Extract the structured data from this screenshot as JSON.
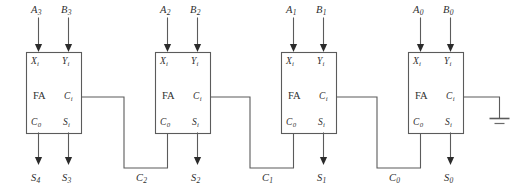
{
  "diagram": {
    "block_label": "FA",
    "pin_labels": {
      "x_in": "X",
      "x_in_sub": "i",
      "y_in": "Y",
      "y_in_sub": "i",
      "carry_in": "C",
      "carry_in_sub": "i",
      "carry_out": "C",
      "carry_out_sub": "0",
      "sum_out": "S",
      "sum_out_sub": "i"
    },
    "colors": {
      "wire": "#5b5b5b",
      "box_stroke": "#5b5b5b",
      "box_fill": "#ffffff",
      "text": "#2f2f2f",
      "arrowhead": "#2b2b2b",
      "background": "#ffffff"
    },
    "stages": [
      {
        "name": "stage-3",
        "input_a": "A",
        "input_a_sub": "3",
        "input_b": "B",
        "input_b_sub": "3",
        "sum_label": "S",
        "sum_label_sub": "3",
        "overflow_label": "S",
        "overflow_label_sub": "4",
        "carry_wire_label": "",
        "carry_wire_label_sub": ""
      },
      {
        "name": "stage-2",
        "input_a": "A",
        "input_a_sub": "2",
        "input_b": "B",
        "input_b_sub": "2",
        "sum_label": "S",
        "sum_label_sub": "2",
        "carry_wire_label": "C",
        "carry_wire_label_sub": "2"
      },
      {
        "name": "stage-1",
        "input_a": "A",
        "input_a_sub": "1",
        "input_b": "B",
        "input_b_sub": "1",
        "sum_label": "S",
        "sum_label_sub": "1",
        "carry_wire_label": "C",
        "carry_wire_label_sub": "1"
      },
      {
        "name": "stage-0",
        "input_a": "A",
        "input_a_sub": "0",
        "input_b": "B",
        "input_b_sub": "0",
        "sum_label": "S",
        "sum_label_sub": "0",
        "carry_wire_label": "C",
        "carry_wire_label_sub": "0"
      }
    ],
    "ground": {
      "name": "ground-symbol",
      "attached_to": "carry-in of least significant full adder"
    }
  }
}
